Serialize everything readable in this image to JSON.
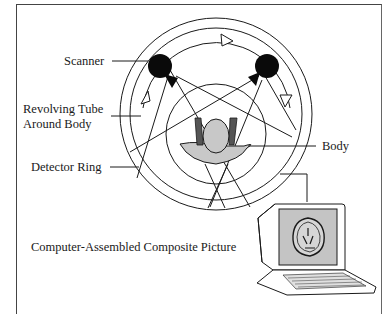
{
  "diagram": {
    "type": "CT scanner illustration",
    "labels": {
      "scanner": "Scanner",
      "revolving_tube_line1": "Revolving Tube",
      "revolving_tube_line2": "Around Body",
      "detector_ring": "Detector Ring",
      "body": "Body",
      "composite_picture": "Computer-Assembled Composite Picture"
    },
    "colors": {
      "line": "#1a1a1a",
      "body_fill": "#c8c8c8",
      "screen_fill": "#c4c4c4",
      "background": "#ffffff"
    }
  }
}
